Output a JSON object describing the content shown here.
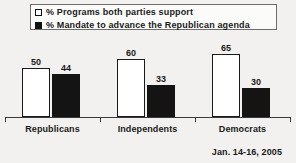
{
  "chart_data": {
    "type": "bar",
    "title": "",
    "subtitle": "",
    "xlabel": "",
    "ylabel": "",
    "ylim": [
      0,
      70
    ],
    "grid": false,
    "legend_position": "top",
    "categories": [
      "Republicans",
      "Independents",
      "Democrats"
    ],
    "series": [
      {
        "name": "% Programs both parties support",
        "swatch": "open-square",
        "color": "#ffffff",
        "values": [
          50,
          60,
          65
        ]
      },
      {
        "name": "% Mandate to advance the Republican agenda",
        "swatch": "filled-square",
        "color": "#141414",
        "values": [
          44,
          33,
          30
        ]
      }
    ],
    "annotation": "Jan. 14-16, 2005"
  },
  "legend": {
    "items": [
      {
        "label": "% Programs both parties support",
        "swatch_icon": "open-square-icon"
      },
      {
        "label": "% Mandate to advance the Republican agenda",
        "swatch_icon": "filled-square-icon"
      }
    ]
  },
  "footer": {
    "date_range": "Jan. 14-16, 2005"
  },
  "colors": {
    "background": "#f2f1ef",
    "axis": "#3a3a3a",
    "bar_open": "#ffffff",
    "bar_filled": "#141414",
    "text": "#1a1a1a",
    "legend_border": "#6d6d6d"
  }
}
